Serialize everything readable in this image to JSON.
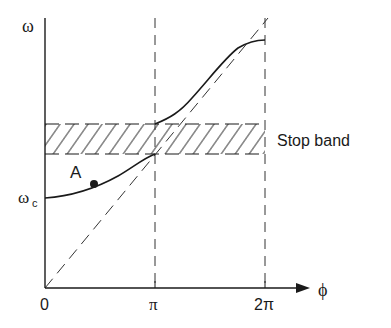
{
  "diagram": {
    "type": "dispersion-curve",
    "y_axis": {
      "label": "ω"
    },
    "x_axis": {
      "label": "ϕ",
      "ticks": [
        "0",
        "π",
        "2π"
      ]
    },
    "y_ticks": {
      "wc": "ω",
      "wc_sub": "c"
    },
    "point_label": "A",
    "band_label": "Stop band",
    "colors": {
      "ink": "#1a1a1a",
      "background": "#ffffff"
    }
  }
}
